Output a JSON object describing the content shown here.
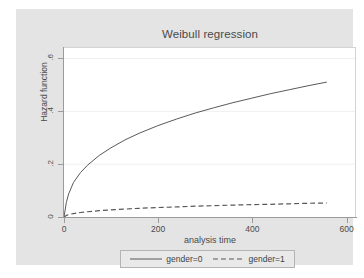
{
  "chart_data": {
    "type": "line",
    "title": "Weibull regression",
    "xlabel": "analysis time",
    "ylabel": "Hazard function",
    "xlim": [
      0,
      620
    ],
    "ylim": [
      0,
      0.64
    ],
    "xticks": [
      0,
      200,
      400,
      600
    ],
    "xticklabels": [
      "0",
      "200",
      "400",
      "600"
    ],
    "yticks": [
      0,
      0.2,
      0.4,
      0.6
    ],
    "yticklabels": [
      "0",
      ".2",
      ".4",
      ".6"
    ],
    "grid": "horizontal-faint",
    "legend_position": "below-center",
    "series": [
      {
        "name": "gender=0",
        "style": "solid",
        "color": "#585858",
        "x": [
          0,
          5,
          10,
          20,
          35,
          50,
          75,
          100,
          130,
          160,
          200,
          240,
          280,
          320,
          360,
          400,
          440,
          480,
          520,
          560
        ],
        "y": [
          0.0,
          0.055,
          0.088,
          0.13,
          0.168,
          0.196,
          0.233,
          0.262,
          0.292,
          0.317,
          0.346,
          0.371,
          0.394,
          0.414,
          0.433,
          0.45,
          0.467,
          0.482,
          0.497,
          0.511
        ]
      },
      {
        "name": "gender=1",
        "style": "dashed",
        "color": "#585858",
        "x": [
          0,
          5,
          10,
          20,
          35,
          50,
          75,
          100,
          130,
          160,
          200,
          240,
          280,
          320,
          360,
          400,
          440,
          480,
          520,
          560
        ],
        "y": [
          0.0,
          0.006,
          0.009,
          0.013,
          0.017,
          0.02,
          0.024,
          0.027,
          0.03,
          0.033,
          0.036,
          0.038,
          0.041,
          0.043,
          0.045,
          0.047,
          0.048,
          0.05,
          0.052,
          0.053
        ]
      }
    ]
  },
  "legend": {
    "entries": [
      {
        "label": "gender=0",
        "style": "solid"
      },
      {
        "label": "gender=1",
        "style": "dashed"
      }
    ]
  },
  "colors": {
    "graph_background": "#e4e4e4",
    "plot_background": "#ffffff",
    "axis": "#9b9b9b",
    "text": "#4a4a4a",
    "line": "#585858"
  }
}
